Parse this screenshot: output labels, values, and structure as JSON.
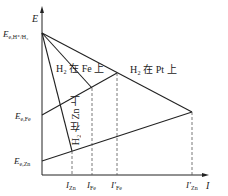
{
  "diagram": {
    "type": "polarization-diagram",
    "axes": {
      "y_label": "E",
      "x_label": "I"
    },
    "potential_labels": [
      {
        "id": "eq_h",
        "text": "E",
        "sub": "e,H⁺/H₂"
      },
      {
        "id": "eq_fe",
        "text": "E",
        "sub": "e,Fe"
      },
      {
        "id": "eq_zn",
        "text": "E",
        "sub": "e,Zn"
      }
    ],
    "current_labels": [
      {
        "id": "i_zn",
        "text": "I",
        "sub": "Zn"
      },
      {
        "id": "i_fe",
        "text": "I",
        "sub": "Fe"
      },
      {
        "id": "i_fe_prime",
        "text": "I′",
        "sub": "Fe"
      },
      {
        "id": "i_zn_prime",
        "text": "I′",
        "sub": "Zn"
      }
    ],
    "curve_labels": {
      "h2_on_fe": "H₂ 在 Fe 上",
      "h2_on_pt": "H₂ 在 Pt 上",
      "h2_on_zn": "H₂ 在 Zn 上"
    },
    "colors": {
      "line": "#222222",
      "dashed": "#555555",
      "background": "#ffffff"
    }
  }
}
